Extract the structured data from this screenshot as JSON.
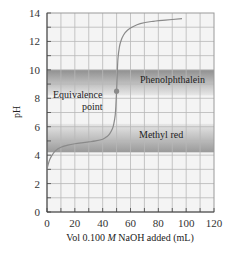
{
  "chart_data": {
    "type": "line",
    "title": "",
    "xlabel": "Vol 0.100 M NaOH added (mL)",
    "xlabel_parts": {
      "pre": "Vol 0.100 ",
      "italic": "M",
      "post": " NaOH added (mL)"
    },
    "ylabel": "pH",
    "xlim": [
      0,
      120
    ],
    "ylim": [
      0,
      14
    ],
    "x_ticks": [
      0,
      20,
      40,
      60,
      80,
      100,
      120
    ],
    "y_ticks": [
      0,
      2,
      4,
      6,
      8,
      10,
      12,
      14
    ],
    "grid": true,
    "grid_x_step": 10,
    "grid_y_step": 1,
    "series": [
      {
        "name": "Titration curve",
        "color": "#8a8a8a",
        "x": [
          0,
          1,
          2,
          4,
          6,
          10,
          15,
          20,
          25,
          30,
          35,
          40,
          43,
          45,
          47,
          48,
          49,
          49.5,
          50,
          50.5,
          51,
          52,
          53,
          55,
          58,
          62,
          67,
          75,
          85,
          97
        ],
        "y": [
          3.0,
          3.4,
          3.7,
          4.05,
          4.3,
          4.55,
          4.7,
          4.8,
          4.87,
          4.93,
          5.0,
          5.12,
          5.3,
          5.5,
          5.85,
          6.2,
          6.8,
          7.5,
          8.5,
          9.8,
          10.8,
          11.6,
          12.0,
          12.45,
          12.8,
          13.05,
          13.25,
          13.4,
          13.5,
          13.6
        ]
      }
    ],
    "annotations": [
      {
        "type": "point",
        "label": "Equivalence point",
        "x": 50,
        "y": 8.5,
        "color": "#8a8a8a"
      },
      {
        "type": "band",
        "label": "Phenolphthalein",
        "y_range": [
          8.2,
          10.0
        ],
        "color": "#9e9e9e"
      },
      {
        "type": "band",
        "label": "Methyl red",
        "y_range": [
          4.2,
          6.2
        ],
        "color": "#9e9e9e"
      }
    ]
  },
  "labels": {
    "equivalence_line1": "Equivalence",
    "equivalence_line2": "point",
    "phenolphthalein": "Phenolphthalein",
    "methyl_red": "Methyl red",
    "ylabel": "pH",
    "xlabel_pre": "Vol 0.100 ",
    "xlabel_italic": "M",
    "xlabel_post": " NaOH added (mL)"
  }
}
